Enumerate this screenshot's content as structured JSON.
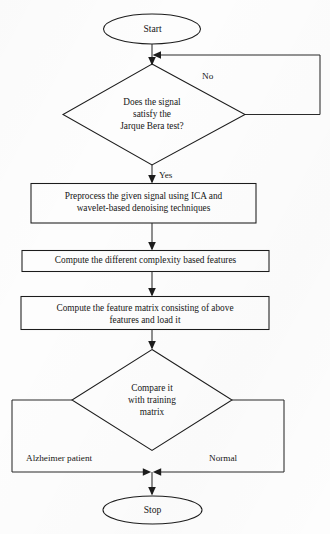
{
  "diagram": {
    "type": "flowchart",
    "background_color": "#fdfdfd",
    "stroke_color": "#1c1c1c",
    "text_color": "#161616"
  },
  "nodes": {
    "start": {
      "label": "Start",
      "shape": "terminal-ellipse"
    },
    "decision_jarque_bera": {
      "label": "Does the signal\nsatisfy the\nJarque Bera test?",
      "shape": "decision-diamond"
    },
    "process_preprocess": {
      "label": "Preprocess the given signal using ICA and\nwavelet-based denoising techniques",
      "shape": "process-rect"
    },
    "process_complexity": {
      "label": "Compute the different complexity based features",
      "shape": "process-rect"
    },
    "process_feature_matrix": {
      "label": "Compute the feature matrix consisting of above\nfeatures and load it",
      "shape": "process-rect"
    },
    "decision_compare": {
      "label": "Compare it\nwith training\nmatrix",
      "shape": "decision-diamond"
    },
    "stop": {
      "label": "Stop",
      "shape": "terminal-ellipse"
    }
  },
  "edge_labels": {
    "no_branch": "No",
    "yes_branch": "Yes",
    "left_outcome": "Alzheimer patient",
    "right_outcome": "Normal"
  }
}
